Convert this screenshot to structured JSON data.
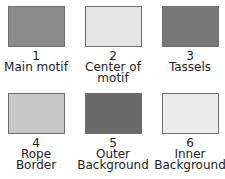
{
  "swatches": [
    {
      "number": "1",
      "label_line1": "Main motif",
      "label_line2": "",
      "color": "#8c8c8c"
    },
    {
      "number": "2",
      "label_line1": "Center of",
      "label_line2": "motif",
      "color": "#e4e4e4"
    },
    {
      "number": "3",
      "label_line1": "Tassels",
      "label_line2": "",
      "color": "#777777"
    },
    {
      "number": "4",
      "label_line1": "Rope",
      "label_line2": "Border",
      "color": "#c8c8c8"
    },
    {
      "number": "5",
      "label_line1": "Outer",
      "label_line2": "Background",
      "color": "#6a6a6a"
    },
    {
      "number": "6",
      "label_line1": "Inner",
      "label_line2": "Background",
      "color": "#ebebeb"
    }
  ]
}
